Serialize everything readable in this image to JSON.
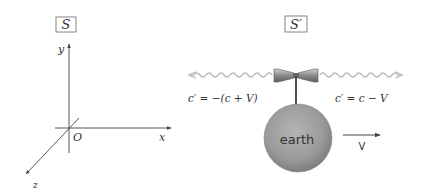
{
  "frame_S": {
    "label": "S",
    "axes": {
      "x": "x",
      "y": "y",
      "z": "z",
      "origin": "O"
    }
  },
  "frame_S_prime": {
    "label": "S′",
    "left_signal": {
      "label": "c′ = −(c + V)",
      "direction": "left"
    },
    "right_signal": {
      "label": "c′ = c − V",
      "direction": "right"
    },
    "body": {
      "label": "earth",
      "color": "#9a9a9a"
    },
    "velocity": {
      "label": "V",
      "direction": "right"
    }
  },
  "colors": {
    "line": "#444444",
    "wave": "#bbbbbb",
    "earth_fill": "#9a9a9a"
  }
}
